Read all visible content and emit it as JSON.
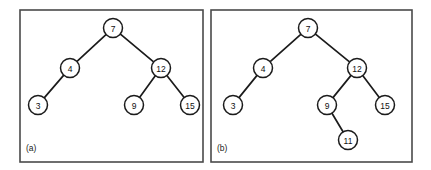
{
  "figure": {
    "background_color": "#ffffff",
    "line_color": "#1b1b1b",
    "frame_color": "#4a4a4a",
    "node_fill": "#ffffff",
    "node_radius": 9.5
  },
  "panels": [
    {
      "id": "a",
      "caption": "(a)",
      "caption_x": 26,
      "caption_y": 148,
      "frame": {
        "x": 20,
        "y": 10,
        "width": 183,
        "height": 152
      },
      "nodes": [
        {
          "id": "a7",
          "label": "7",
          "cx": 113,
          "cy": 28
        },
        {
          "id": "a4",
          "label": "4",
          "cx": 70,
          "cy": 68
        },
        {
          "id": "a12",
          "label": "12",
          "cx": 161,
          "cy": 68
        },
        {
          "id": "a3",
          "label": "3",
          "cx": 38,
          "cy": 105
        },
        {
          "id": "a9",
          "label": "9",
          "cx": 134,
          "cy": 105
        },
        {
          "id": "a15",
          "label": "15",
          "cx": 190,
          "cy": 105
        }
      ],
      "edges": [
        {
          "from": "a7",
          "to": "a4"
        },
        {
          "from": "a7",
          "to": "a12"
        },
        {
          "from": "a4",
          "to": "a3"
        },
        {
          "from": "a12",
          "to": "a9"
        },
        {
          "from": "a12",
          "to": "a15"
        }
      ]
    },
    {
      "id": "b",
      "caption": "(b)",
      "caption_x": 217,
      "caption_y": 148,
      "frame": {
        "x": 211,
        "y": 10,
        "width": 201,
        "height": 152
      },
      "nodes": [
        {
          "id": "b7",
          "label": "7",
          "cx": 308,
          "cy": 28
        },
        {
          "id": "b4",
          "label": "4",
          "cx": 263,
          "cy": 68
        },
        {
          "id": "b12",
          "label": "12",
          "cx": 357,
          "cy": 68
        },
        {
          "id": "b3",
          "label": "3",
          "cx": 233,
          "cy": 105
        },
        {
          "id": "b9",
          "label": "9",
          "cx": 327,
          "cy": 105
        },
        {
          "id": "b15",
          "label": "15",
          "cx": 385,
          "cy": 105
        },
        {
          "id": "b11",
          "label": "11",
          "cx": 348,
          "cy": 140
        }
      ],
      "edges": [
        {
          "from": "b7",
          "to": "b4"
        },
        {
          "from": "b7",
          "to": "b12"
        },
        {
          "from": "b4",
          "to": "b3"
        },
        {
          "from": "b12",
          "to": "b9"
        },
        {
          "from": "b12",
          "to": "b15"
        },
        {
          "from": "b9",
          "to": "b11"
        }
      ]
    }
  ]
}
